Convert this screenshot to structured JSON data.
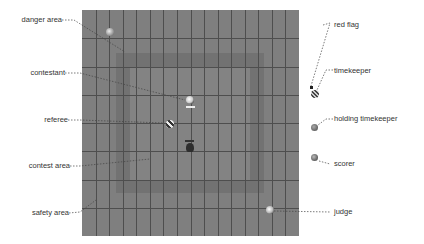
{
  "diagram": {
    "board": {
      "columns": 16,
      "rows": 8,
      "color": "#7f7f7f",
      "line_color": "#4e4e4e"
    },
    "zones": {
      "safety_area": "safety area",
      "danger_area": "danger area",
      "contest_area": "contest area"
    },
    "left_labels": [
      {
        "id": "danger-area",
        "text": "danger area"
      },
      {
        "id": "contestant",
        "text": "contestant"
      },
      {
        "id": "referee",
        "text": "referee"
      },
      {
        "id": "contest-area",
        "text": "contest area"
      },
      {
        "id": "safety-area",
        "text": "safety area"
      }
    ],
    "right_labels": [
      {
        "id": "red-flag",
        "text": "red flag"
      },
      {
        "id": "timekeeper",
        "text": "timekeeper"
      },
      {
        "id": "holding-timekeeper",
        "text": "holding timekeeper"
      },
      {
        "id": "scorer",
        "text": "scorer"
      },
      {
        "id": "judge",
        "text": "judge"
      }
    ]
  }
}
